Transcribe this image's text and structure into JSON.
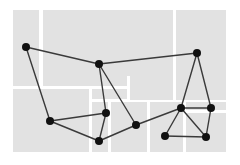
{
  "diagram": {
    "type": "network-graph-over-block-map",
    "background_color": "#ffffff",
    "block_color": "#e2e2e2",
    "gap_color": "#ffffff",
    "edge_color": "#3a3a3a",
    "node_color": "#111111",
    "node_radius": 4,
    "blocks": [
      {
        "x": 13,
        "y": 10,
        "w": 26,
        "h": 76
      },
      {
        "x": 43,
        "y": 10,
        "w": 130,
        "h": 66
      },
      {
        "x": 176,
        "y": 10,
        "w": 50,
        "h": 90
      },
      {
        "x": 130,
        "y": 76,
        "w": 43,
        "h": 24
      },
      {
        "x": 43,
        "y": 76,
        "w": 84,
        "h": 10
      },
      {
        "x": 13,
        "y": 89,
        "w": 76,
        "h": 63
      },
      {
        "x": 92,
        "y": 89,
        "w": 35,
        "h": 10
      },
      {
        "x": 92,
        "y": 102,
        "w": 16,
        "h": 50
      },
      {
        "x": 111,
        "y": 102,
        "w": 36,
        "h": 50
      },
      {
        "x": 150,
        "y": 102,
        "w": 33,
        "h": 50
      },
      {
        "x": 186,
        "y": 102,
        "w": 40,
        "h": 8
      },
      {
        "x": 186,
        "y": 113,
        "w": 40,
        "h": 39
      },
      {
        "x": 130,
        "y": 89,
        "w": 17,
        "h": 10
      },
      {
        "x": 150,
        "y": 89,
        "w": 23,
        "h": 10
      }
    ],
    "nodes": [
      {
        "id": "A",
        "x": 26,
        "y": 47
      },
      {
        "id": "B",
        "x": 99,
        "y": 64
      },
      {
        "id": "C",
        "x": 197,
        "y": 53
      },
      {
        "id": "D",
        "x": 50,
        "y": 121
      },
      {
        "id": "E",
        "x": 106,
        "y": 113
      },
      {
        "id": "F",
        "x": 99,
        "y": 141
      },
      {
        "id": "G",
        "x": 136,
        "y": 125
      },
      {
        "id": "H",
        "x": 181,
        "y": 108
      },
      {
        "id": "I",
        "x": 211,
        "y": 108
      },
      {
        "id": "J",
        "x": 165,
        "y": 136
      },
      {
        "id": "K",
        "x": 206,
        "y": 137
      }
    ],
    "edges": [
      [
        "A",
        "B"
      ],
      [
        "A",
        "D"
      ],
      [
        "B",
        "C"
      ],
      [
        "B",
        "E"
      ],
      [
        "B",
        "G"
      ],
      [
        "C",
        "H"
      ],
      [
        "C",
        "I"
      ],
      [
        "D",
        "E"
      ],
      [
        "D",
        "F"
      ],
      [
        "E",
        "F"
      ],
      [
        "F",
        "G"
      ],
      [
        "G",
        "H"
      ],
      [
        "H",
        "I"
      ],
      [
        "H",
        "J"
      ],
      [
        "H",
        "K"
      ],
      [
        "I",
        "K"
      ],
      [
        "J",
        "K"
      ]
    ]
  }
}
